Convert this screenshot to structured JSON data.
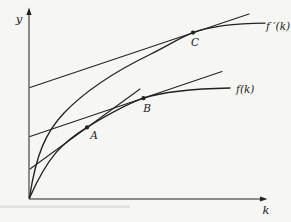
{
  "figure": {
    "colors": {
      "background": "#f6f6f4",
      "line": "#222222",
      "label": "#1a1a1a",
      "scan_artifact": "#cfcfcb"
    },
    "axes": {
      "y_label": "y",
      "x_label": "k"
    },
    "curves": {
      "f": {
        "label": "f(k)"
      },
      "f_prime": {
        "label": "f ′(k)"
      }
    },
    "points": {
      "a": {
        "label": "A"
      },
      "b": {
        "label": "B"
      },
      "c": {
        "label": "C"
      }
    }
  }
}
